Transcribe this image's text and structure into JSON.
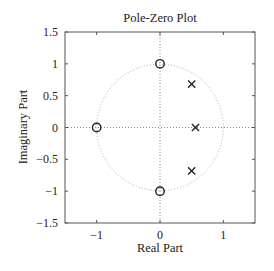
{
  "chart_data": {
    "type": "scatter",
    "title": "Pole-Zero Plot",
    "xlabel": "Real Part",
    "ylabel": "Imaginary Part",
    "xlim": [
      -1.5,
      1.5
    ],
    "ylim": [
      -1.5,
      1.5
    ],
    "xticks": [
      -1,
      0,
      1
    ],
    "xtick_labels": [
      "−1",
      "0",
      "1"
    ],
    "yticks": [
      1.5,
      1,
      0.5,
      0,
      -0.5,
      -1,
      -1.5
    ],
    "ytick_labels": [
      "1.5",
      "1",
      "0.5",
      "0",
      "−0.5",
      "−1",
      "−1.5"
    ],
    "grid": false,
    "unit_circle": true,
    "axis_lines_dotted": true,
    "series": [
      {
        "name": "Zeros",
        "marker": "circle",
        "points": [
          {
            "x": -1,
            "y": 0
          },
          {
            "x": 0,
            "y": 1
          },
          {
            "x": 0,
            "y": -1
          }
        ]
      },
      {
        "name": "Poles",
        "marker": "x",
        "points": [
          {
            "x": 0.5,
            "y": 0.68
          },
          {
            "x": 0.56,
            "y": 0
          },
          {
            "x": 0.5,
            "y": -0.68
          }
        ]
      }
    ],
    "colors": {
      "axes": "#555555",
      "markers": "#222222",
      "reference_lines": "#888888",
      "unit_circle": "#aaaaaa"
    }
  }
}
